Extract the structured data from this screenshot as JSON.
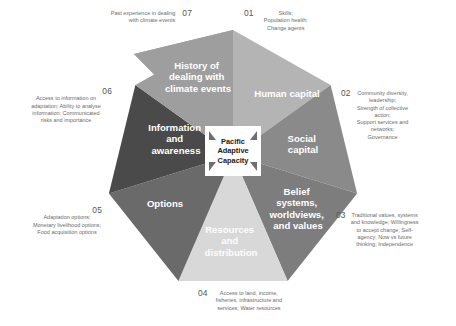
{
  "diagram": {
    "center": {
      "line1": "Pacific",
      "line2": "Adaptive",
      "line3": "Capacity"
    },
    "colors": {
      "human_capital": "#b4b4b4",
      "social_capital": "#8a8a8a",
      "belief_systems": "#7d7d7d",
      "resources": "#d8d8d8",
      "options": "#6a6a6a",
      "information": "#4a4a4a",
      "history": "#9e9e9e",
      "annotation_text": "#6b6b6b",
      "segment_text": "#ffffff"
    },
    "segments": [
      {
        "number": "01",
        "label": "Human capital",
        "label_lines": [
          "Human capital"
        ],
        "description": "Skills;\nPopulation health;\nChange agents",
        "description_lines": [
          "Skills;",
          "Population health;",
          "Change agents"
        ],
        "fill": "#b4b4b4"
      },
      {
        "number": "02",
        "label": "Social capital",
        "label_lines": [
          "Social",
          "capital"
        ],
        "description": "Community diversity, leadership; Strength of collective action; Support services and networks; Governance",
        "description_lines": [
          "Community diversity,",
          "leadership;",
          "Strength of collective",
          "action;",
          "Support services and",
          "networks;",
          "Governance"
        ],
        "fill": "#8a8a8a"
      },
      {
        "number": "03",
        "label": "Belief systems, worldviews, and values",
        "label_lines": [
          "Belief",
          "systems,",
          "worldviews,",
          "and values"
        ],
        "description": "Traditional values, systems and knowledge; Willingness to accept change; Self-agency; Now vs future thinking; Independence",
        "description_lines": [
          "Traditional values, systems",
          "and knowledge; Willingness",
          "to accept change; Self-",
          "agency; Now vs future",
          "thinking; Independence"
        ],
        "fill": "#7d7d7d"
      },
      {
        "number": "04",
        "label": "Resources and distribution",
        "label_lines": [
          "Resources",
          "and",
          "distribution"
        ],
        "description": "Access to land, income, fisheries, infrastructure and services; Water resources",
        "description_lines": [
          "Access to land, income,",
          "fisheries, infrastructure and",
          "services; Water resources"
        ],
        "fill": "#d8d8d8"
      },
      {
        "number": "05",
        "label": "Options",
        "label_lines": [
          "Options"
        ],
        "description": "Adaptation options; Monetary livelihood options; Food acquisition options",
        "description_lines": [
          "Adaptation options;",
          "Monetary livelihood options;",
          "Food acquisition options"
        ],
        "fill": "#6a6a6a"
      },
      {
        "number": "06",
        "label": "Information and awareness",
        "label_lines": [
          "Information",
          "and",
          "awareness"
        ],
        "description": "Access to information on adaptation; Ability to analyse information; Communicated risks and importance",
        "description_lines": [
          "Access to information on",
          "adaptation; Ability to analyse",
          "information; Communicated",
          "risks and importance"
        ],
        "fill": "#4a4a4a"
      },
      {
        "number": "07",
        "label": "History of dealing with climate events",
        "label_lines": [
          "History of",
          "dealing with",
          "climate events"
        ],
        "description": "Past experience in dealing with climate events",
        "description_lines": [
          "Past experience in dealing",
          "with climate events"
        ],
        "fill": "#9e9e9e"
      }
    ]
  }
}
